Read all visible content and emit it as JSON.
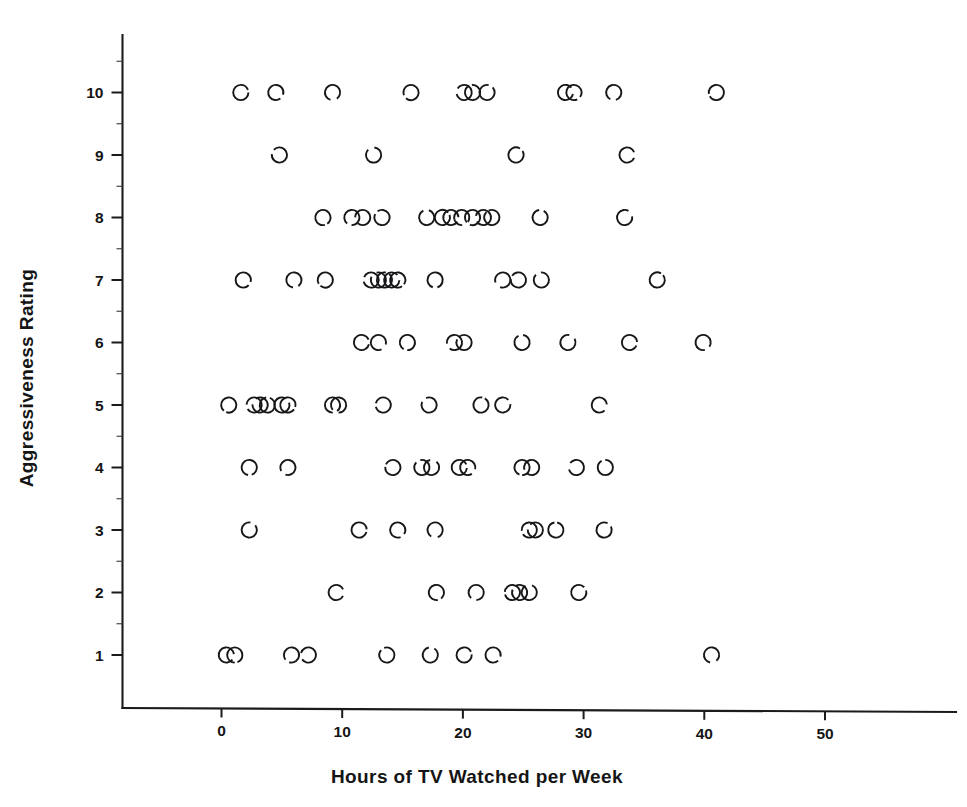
{
  "chart_data": {
    "type": "scatter",
    "title": "",
    "xlabel": "Hours of TV Watched per Week",
    "ylabel": "Aggressiveness Rating",
    "xlim": [
      -5,
      58
    ],
    "ylim": [
      0.1,
      11.4
    ],
    "xticks": [
      0,
      10,
      20,
      30,
      40,
      50
    ],
    "xtick_labels": [
      "0",
      "10",
      "20",
      "30",
      "40",
      "50"
    ],
    "yticks": [
      1,
      2,
      3,
      4,
      5,
      6,
      7,
      8,
      9,
      10
    ],
    "ytick_labels": [
      "1",
      "2",
      "3",
      "4",
      "5",
      "6",
      "7",
      "8",
      "9",
      "10"
    ],
    "x_minor_ticks": [],
    "y_minor_ticks": [
      1.5,
      2.5,
      3.5,
      4.5,
      5.5,
      6.5,
      7.5,
      8.5,
      9.5,
      10.5
    ],
    "grid": false,
    "legend": false,
    "marker": "open-circle",
    "marker_color": "#17171a",
    "point_count": 86,
    "points": [
      {
        "x": 1.6,
        "y": 10
      },
      {
        "x": 4.5,
        "y": 10
      },
      {
        "x": 9.2,
        "y": 10
      },
      {
        "x": 15.7,
        "y": 10
      },
      {
        "x": 20.1,
        "y": 10
      },
      {
        "x": 20.8,
        "y": 10
      },
      {
        "x": 22.0,
        "y": 10
      },
      {
        "x": 28.5,
        "y": 10
      },
      {
        "x": 29.2,
        "y": 10
      },
      {
        "x": 32.5,
        "y": 10
      },
      {
        "x": 41.0,
        "y": 10
      },
      {
        "x": 4.8,
        "y": 9
      },
      {
        "x": 12.6,
        "y": 9
      },
      {
        "x": 24.4,
        "y": 9
      },
      {
        "x": 33.6,
        "y": 9
      },
      {
        "x": 8.4,
        "y": 8
      },
      {
        "x": 10.8,
        "y": 8
      },
      {
        "x": 11.7,
        "y": 8
      },
      {
        "x": 13.3,
        "y": 8
      },
      {
        "x": 17.0,
        "y": 8
      },
      {
        "x": 18.3,
        "y": 8
      },
      {
        "x": 19.0,
        "y": 8
      },
      {
        "x": 19.9,
        "y": 8
      },
      {
        "x": 20.8,
        "y": 8
      },
      {
        "x": 21.7,
        "y": 8
      },
      {
        "x": 22.4,
        "y": 8
      },
      {
        "x": 26.4,
        "y": 8
      },
      {
        "x": 33.4,
        "y": 8
      },
      {
        "x": 1.8,
        "y": 7
      },
      {
        "x": 6.0,
        "y": 7
      },
      {
        "x": 8.6,
        "y": 7
      },
      {
        "x": 12.4,
        "y": 7
      },
      {
        "x": 13.0,
        "y": 7
      },
      {
        "x": 13.5,
        "y": 7
      },
      {
        "x": 14.1,
        "y": 7
      },
      {
        "x": 14.6,
        "y": 7
      },
      {
        "x": 17.7,
        "y": 7
      },
      {
        "x": 23.3,
        "y": 7
      },
      {
        "x": 24.6,
        "y": 7
      },
      {
        "x": 26.5,
        "y": 7
      },
      {
        "x": 36.1,
        "y": 7
      },
      {
        "x": 11.6,
        "y": 6
      },
      {
        "x": 13.0,
        "y": 6
      },
      {
        "x": 15.4,
        "y": 6
      },
      {
        "x": 19.3,
        "y": 6
      },
      {
        "x": 20.1,
        "y": 6
      },
      {
        "x": 24.9,
        "y": 6
      },
      {
        "x": 28.7,
        "y": 6
      },
      {
        "x": 33.8,
        "y": 6
      },
      {
        "x": 39.9,
        "y": 6
      },
      {
        "x": 0.6,
        "y": 5
      },
      {
        "x": 2.7,
        "y": 5
      },
      {
        "x": 3.2,
        "y": 5
      },
      {
        "x": 3.8,
        "y": 5
      },
      {
        "x": 5.0,
        "y": 5
      },
      {
        "x": 5.5,
        "y": 5
      },
      {
        "x": 9.2,
        "y": 5
      },
      {
        "x": 9.7,
        "y": 5
      },
      {
        "x": 13.4,
        "y": 5
      },
      {
        "x": 17.2,
        "y": 5
      },
      {
        "x": 21.5,
        "y": 5
      },
      {
        "x": 23.3,
        "y": 5
      },
      {
        "x": 31.3,
        "y": 5
      },
      {
        "x": 2.3,
        "y": 4
      },
      {
        "x": 5.5,
        "y": 4
      },
      {
        "x": 14.2,
        "y": 4
      },
      {
        "x": 16.6,
        "y": 4
      },
      {
        "x": 17.4,
        "y": 4
      },
      {
        "x": 19.7,
        "y": 4
      },
      {
        "x": 20.4,
        "y": 4
      },
      {
        "x": 24.9,
        "y": 4
      },
      {
        "x": 25.7,
        "y": 4
      },
      {
        "x": 29.4,
        "y": 4
      },
      {
        "x": 31.8,
        "y": 4
      },
      {
        "x": 2.3,
        "y": 3
      },
      {
        "x": 11.4,
        "y": 3
      },
      {
        "x": 14.6,
        "y": 3
      },
      {
        "x": 17.7,
        "y": 3
      },
      {
        "x": 25.5,
        "y": 3
      },
      {
        "x": 26.0,
        "y": 3
      },
      {
        "x": 27.7,
        "y": 3
      },
      {
        "x": 31.7,
        "y": 3
      },
      {
        "x": 9.5,
        "y": 2
      },
      {
        "x": 17.8,
        "y": 2
      },
      {
        "x": 21.1,
        "y": 2
      },
      {
        "x": 24.1,
        "y": 2
      },
      {
        "x": 24.7,
        "y": 2
      },
      {
        "x": 25.5,
        "y": 2
      },
      {
        "x": 29.6,
        "y": 2
      },
      {
        "x": 0.4,
        "y": 1
      },
      {
        "x": 1.1,
        "y": 1
      },
      {
        "x": 5.8,
        "y": 1
      },
      {
        "x": 7.2,
        "y": 1
      },
      {
        "x": 13.7,
        "y": 1
      },
      {
        "x": 17.3,
        "y": 1
      },
      {
        "x": 20.1,
        "y": 1
      },
      {
        "x": 22.5,
        "y": 1
      },
      {
        "x": 40.6,
        "y": 1
      }
    ]
  }
}
